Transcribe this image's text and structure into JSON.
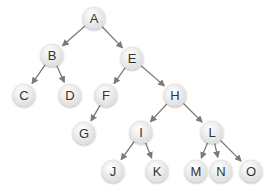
{
  "diagram": {
    "type": "tree",
    "node_radius": 11,
    "colors": {
      "edge": "#7a7a7a",
      "node_fill_light": "#ffffff",
      "node_fill_dark": "#dcdcdc",
      "node_stroke": "#e2e2e2",
      "label": "#333333"
    },
    "nodes": [
      {
        "id": "A",
        "label": "A",
        "x": 94,
        "y": 18
      },
      {
        "id": "B",
        "label": "B",
        "x": 52,
        "y": 55
      },
      {
        "id": "C",
        "label": "C",
        "x": 24,
        "y": 95
      },
      {
        "id": "D",
        "label": "D",
        "x": 70,
        "y": 95
      },
      {
        "id": "E",
        "label": "E",
        "x": 132,
        "y": 58
      },
      {
        "id": "F",
        "label": "F",
        "x": 106,
        "y": 95
      },
      {
        "id": "G",
        "label": "G",
        "x": 84,
        "y": 133
      },
      {
        "id": "H",
        "label": "H",
        "x": 175,
        "y": 95
      },
      {
        "id": "I",
        "label": "I",
        "x": 141,
        "y": 132
      },
      {
        "id": "J",
        "label": "J",
        "x": 113,
        "y": 171
      },
      {
        "id": "K",
        "label": "K",
        "x": 157,
        "y": 171
      },
      {
        "id": "L",
        "label": "L",
        "x": 212,
        "y": 132
      },
      {
        "id": "M",
        "label": "M",
        "x": 196,
        "y": 171
      },
      {
        "id": "N",
        "label": "N",
        "x": 221,
        "y": 171
      },
      {
        "id": "O",
        "label": "O",
        "x": 251,
        "y": 171
      }
    ],
    "edges": [
      {
        "from": "A",
        "to": "B"
      },
      {
        "from": "A",
        "to": "E"
      },
      {
        "from": "B",
        "to": "C"
      },
      {
        "from": "B",
        "to": "D"
      },
      {
        "from": "E",
        "to": "F"
      },
      {
        "from": "E",
        "to": "H"
      },
      {
        "from": "F",
        "to": "G"
      },
      {
        "from": "H",
        "to": "I"
      },
      {
        "from": "H",
        "to": "L"
      },
      {
        "from": "I",
        "to": "J"
      },
      {
        "from": "I",
        "to": "K"
      },
      {
        "from": "L",
        "to": "M"
      },
      {
        "from": "L",
        "to": "N"
      },
      {
        "from": "L",
        "to": "O"
      }
    ]
  }
}
